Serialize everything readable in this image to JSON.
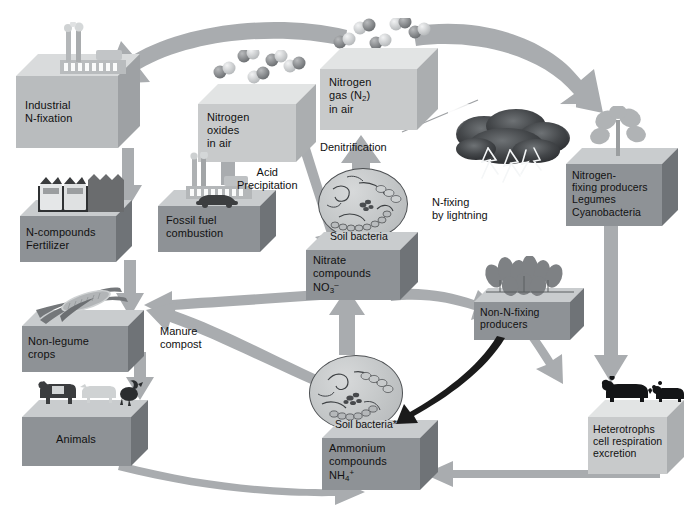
{
  "diagram": {
    "palette": {
      "box_front": "#8e9296",
      "box_top": "#c9ccce",
      "box_side": "#6f7377",
      "arrow_gray": "#a9acaf",
      "arrow_dark": "#1b1b1b",
      "background": "#ffffff",
      "text": "#111111"
    },
    "caption": ""
  },
  "boxes": {
    "industrial": {
      "label": "Industrial\nN-fixation",
      "decoration": "factory-icon"
    },
    "fertilizer": {
      "label": "N-compounds\nFertilizer",
      "decoration": "fertilizer-sacks-icon"
    },
    "crops": {
      "label": "Non-legume\ncrops",
      "decoration": "corn-icon"
    },
    "animals": {
      "label": "Animals",
      "decoration": "livestock-icon"
    },
    "nitrogen_oxides": {
      "label": "Nitrogen\noxides\nin air",
      "decoration": "no-molecules-icon"
    },
    "fossil_fuel": {
      "label": "Fossil fuel\ncombustion",
      "decoration": "powerplant-car-icon"
    },
    "nitrogen_gas": {
      "label_line1": "Nitrogen",
      "label_line2_pre": "gas (N",
      "label_line2_sub": "2",
      "label_line2_post": ")",
      "label_line3": "in air",
      "decoration": "n2-molecules-icon"
    },
    "nitrate": {
      "header": "Soil bacteria",
      "label_line1": "Nitrate",
      "label_line2": "compounds",
      "label_line3_pre": "NO",
      "label_line3_sub": "3",
      "label_line3_sup": "–",
      "decoration": "petri-dish-icon"
    },
    "ammonium": {
      "header": "Soil bacteria*",
      "label_line1": "Ammonium",
      "label_line2": "compounds",
      "label_line3_pre": "NH",
      "label_line3_sub": "4",
      "label_line3_sup": "+",
      "decoration": "petri-dish-icon"
    },
    "n_fixing_producers": {
      "label": "Nitrogen-\nfixing producers\nLegumes\nCyanobacteria",
      "decoration": "seedling-icon"
    },
    "non_n_fixing_producers": {
      "label": "Non-N-fixing\nproducers",
      "decoration": "plants-icon"
    },
    "heterotrophs": {
      "label": "Heterotrophs\ncell respiration\nexcretion",
      "decoration": "bears-icon"
    }
  },
  "annotations": {
    "acid_precipitation": "Acid\nPrecipitation",
    "denitrification": "Denitrification",
    "n_fixing_lightning": "N-fixing\nby lightning",
    "manure_compost": "Manure\ncompost"
  },
  "decorations": {
    "storm_cloud": "lightning-cloud-icon"
  }
}
